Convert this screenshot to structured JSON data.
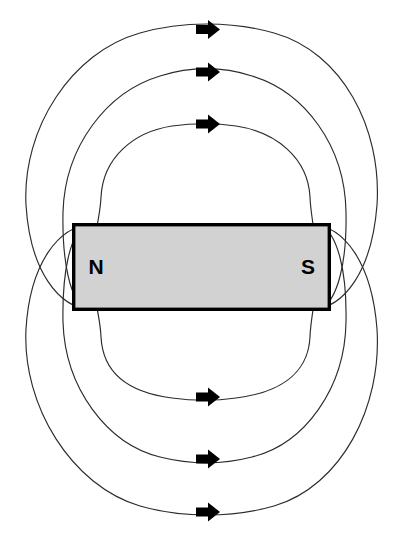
{
  "figure": {
    "background_color": "#ffffff",
    "width": 405,
    "height": 548
  },
  "magnet": {
    "label_north": "N",
    "label_south": "S",
    "fill_color": "#d2d2d2",
    "border_color": "#000000",
    "x": 72,
    "y": 223,
    "width": 259,
    "height": 88
  },
  "field": {
    "line_color": "#2b2b2b",
    "arrow_color": "#000000",
    "arrow_direction": "right",
    "loop_count_top": 3,
    "loop_count_bottom": 3,
    "loops": [
      {
        "name": "outer-loop-top",
        "side": "top",
        "left_x": 25,
        "right_x": 376,
        "apex_y": 29,
        "arrow_x": 207,
        "arrow_y": 29
      },
      {
        "name": "middle-loop-top",
        "side": "top",
        "left_x": 62,
        "right_x": 346,
        "apex_y": 72,
        "arrow_x": 207,
        "arrow_y": 72
      },
      {
        "name": "inner-loop-top",
        "side": "top",
        "left_x": 100,
        "right_x": 312,
        "apex_y": 124,
        "arrow_x": 207,
        "arrow_y": 124
      },
      {
        "name": "inner-loop-bottom",
        "side": "bottom",
        "left_x": 100,
        "right_x": 312,
        "apex_y": 397,
        "arrow_x": 207,
        "arrow_y": 397
      },
      {
        "name": "middle-loop-bottom",
        "side": "bottom",
        "left_x": 62,
        "right_x": 346,
        "apex_y": 459,
        "arrow_x": 207,
        "arrow_y": 459
      },
      {
        "name": "outer-loop-bottom",
        "side": "bottom",
        "left_x": 25,
        "right_x": 376,
        "apex_y": 512,
        "arrow_x": 207,
        "arrow_y": 512
      }
    ]
  }
}
